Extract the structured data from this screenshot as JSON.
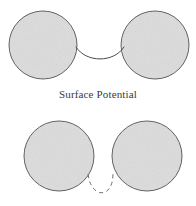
{
  "figure": {
    "width": 196,
    "height": 206,
    "background_color": "#ffffff",
    "caption": "Surface Potential",
    "caption_color": "#3a3a3a",
    "particle_fill_color": "#dcdcdc",
    "particle_stroke_color": "#555555",
    "curve_stroke_color": "#4a4a4a",
    "dashed_curve_stroke_color": "#6e6e6e",
    "panels": [
      {
        "name": "top-panel",
        "description": "Two contacting particles joined by a concave liquid meniscus bridge",
        "bridge_style": "solid",
        "particles": [
          {
            "name": "top-left-particle",
            "cx": 43,
            "cy": 45,
            "r": 34
          },
          {
            "name": "top-right-particle",
            "cx": 155,
            "cy": 45,
            "r": 34
          }
        ],
        "bridge": {
          "name": "meniscus-bridge",
          "start": [
            76,
            47
          ],
          "control_left": [
            86,
            63
          ],
          "control_right": [
            114,
            63
          ],
          "end": [
            124,
            47
          ]
        }
      },
      {
        "name": "bottom-panel",
        "description": "Two separated particles with a dashed meniscus outline indicating rupture",
        "bridge_style": "dashed",
        "dash_pattern": "4 3.5",
        "particles": [
          {
            "name": "bottom-left-particle",
            "cx": 59,
            "cy": 156,
            "r": 35
          },
          {
            "name": "bottom-right-particle",
            "cx": 147,
            "cy": 156,
            "r": 35
          }
        ],
        "bridge": {
          "name": "ruptured-meniscus-bridge",
          "start": [
            88,
            174
          ],
          "control_left": [
            91,
            199
          ],
          "control_right": [
            113,
            199
          ],
          "end": [
            113,
            174
          ]
        }
      }
    ]
  }
}
